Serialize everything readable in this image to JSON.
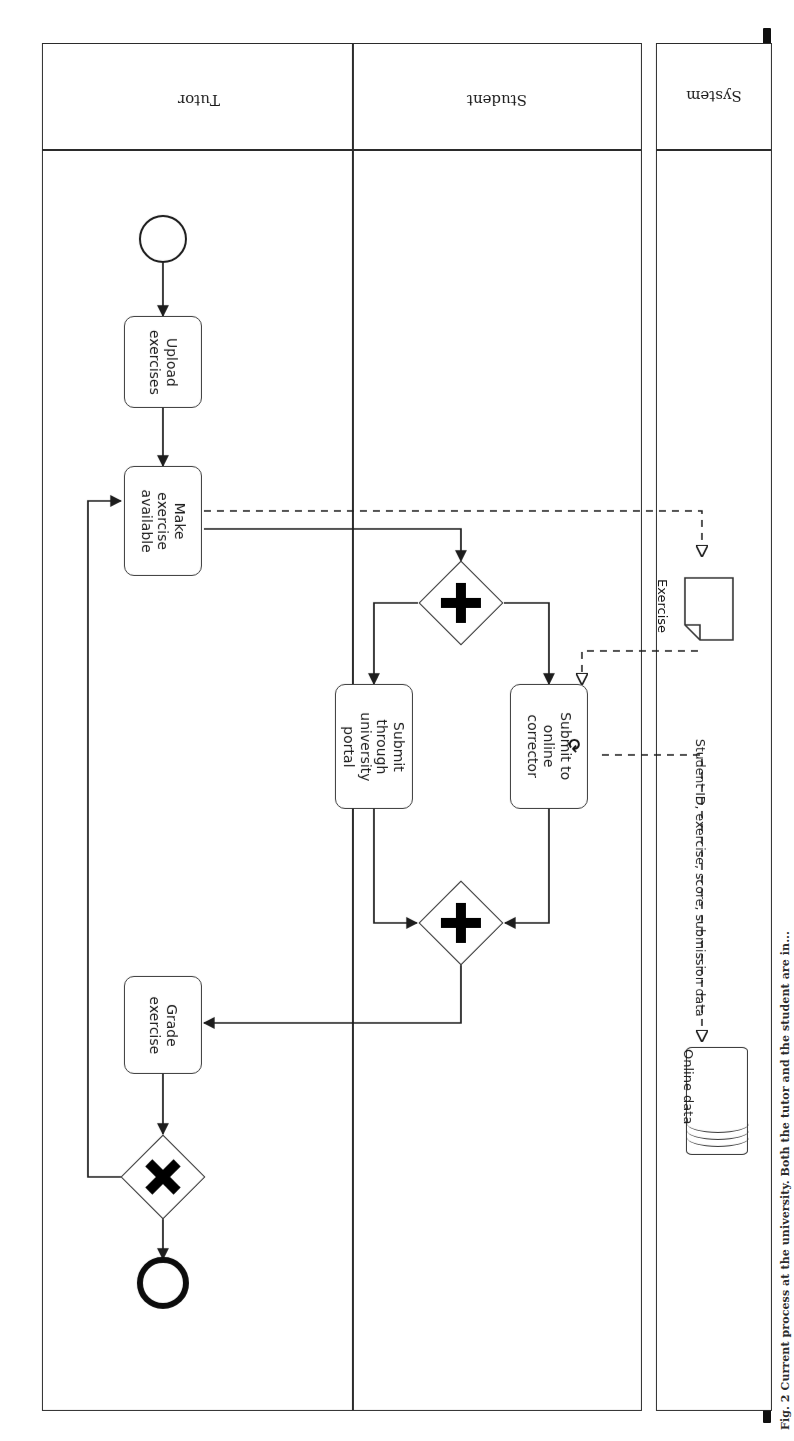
{
  "page": {
    "caption": "Fig. 2 Current process at the university. Both the tutor and the student are in..."
  },
  "pools": [
    {
      "id": "system",
      "label": "System"
    },
    {
      "id": "main",
      "label": ""
    }
  ],
  "lanes": [
    {
      "id": "student",
      "label": "Student"
    },
    {
      "id": "tutor",
      "label": "Tutor"
    }
  ],
  "events": [
    {
      "id": "start",
      "type": "start-event",
      "lane": "tutor",
      "label": ""
    },
    {
      "id": "end",
      "type": "end-event",
      "lane": "tutor",
      "label": ""
    }
  ],
  "tasks": [
    {
      "id": "upload-exercises",
      "label": "Upload\nexercises",
      "lane": "tutor",
      "marker": ""
    },
    {
      "id": "make-available",
      "label": "Make\nexercise\navailable",
      "lane": "tutor",
      "marker": ""
    },
    {
      "id": "submit-online",
      "label": "Submit to\nonline\ncorrector",
      "lane": "student",
      "marker": "loop"
    },
    {
      "id": "submit-portal",
      "label": "Submit\nthrough\nuniversity\nportal",
      "lane": "student",
      "marker": ""
    },
    {
      "id": "grade-exercise",
      "label": "Grade\nexercise",
      "lane": "tutor",
      "marker": ""
    }
  ],
  "gateways": [
    {
      "id": "parallel-split",
      "type": "parallel",
      "symbol": "+",
      "lane": "student"
    },
    {
      "id": "parallel-join",
      "type": "parallel",
      "symbol": "+",
      "lane": "student"
    },
    {
      "id": "exclusive",
      "type": "exclusive",
      "symbol": "X",
      "lane": "tutor"
    }
  ],
  "data": [
    {
      "id": "online-data",
      "type": "data-store",
      "label": "Online data",
      "pool": "system"
    },
    {
      "id": "exercise",
      "type": "data-object",
      "label": "Exercise",
      "pool": "system"
    }
  ],
  "annotations": [
    {
      "id": "submission-data",
      "label": "Student ID, exercise, score, submission data"
    }
  ],
  "colors": {
    "stroke": "#2b2b2b",
    "fill": "#ffffff",
    "marker": "#000000",
    "gutter": "#101010"
  },
  "markers": {
    "loop": "⟳",
    "parallel": "+",
    "exclusive": "X"
  }
}
